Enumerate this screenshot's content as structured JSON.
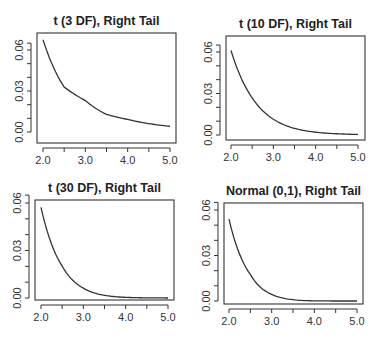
{
  "chart_data": [
    {
      "type": "line",
      "title": "t (3 DF), Right Tail",
      "xlabel": "",
      "ylabel": "",
      "xlim": [
        2.0,
        5.0
      ],
      "ylim": [
        0.0,
        0.065
      ],
      "xticks": [
        "2.0",
        "3.0",
        "4.0",
        "5.0"
      ],
      "yticks": [
        "0.00",
        "0.03",
        "0.06"
      ],
      "grid": false,
      "x": [
        2.0,
        2.5,
        3.0,
        3.5,
        4.0,
        4.5,
        5.0
      ],
      "values": [
        0.0675,
        0.0329,
        0.023,
        0.0129,
        0.0092,
        0.0061,
        0.0042
      ],
      "box": {
        "x0": 37,
        "y0": 33,
        "x1": 176,
        "y1": 143,
        "px_x2": 43,
        "px_x5": 170,
        "px_y0": 132,
        "px_y06": 50
      }
    },
    {
      "type": "line",
      "title": "t (10 DF), Right Tail",
      "xlabel": "",
      "ylabel": "",
      "xlim": [
        2.0,
        5.0
      ],
      "ylim": [
        0.0,
        0.065
      ],
      "xticks": [
        "2.0",
        "3.0",
        "4.0",
        "5.0"
      ],
      "yticks": [
        "0.00",
        "0.03",
        "0.06"
      ],
      "grid": false,
      "x": [
        2.0,
        2.5,
        3.0,
        3.5,
        4.0,
        4.5,
        5.0
      ],
      "values": [
        0.0611,
        0.0269,
        0.0114,
        0.0048,
        0.002,
        0.0009,
        0.0004
      ],
      "box": {
        "x0": 226,
        "y0": 36,
        "x1": 365,
        "y1": 140,
        "px_x2": 231,
        "px_x5": 358,
        "px_y0": 135,
        "px_y06": 52
      }
    },
    {
      "type": "line",
      "title": "t (30 DF), Right Tail",
      "xlabel": "",
      "ylabel": "",
      "xlim": [
        2.0,
        5.0
      ],
      "ylim": [
        0.0,
        0.065
      ],
      "xticks": [
        "2.0",
        "3.0",
        "4.0",
        "5.0"
      ],
      "yticks": [
        "0.00",
        "0.03",
        "0.06"
      ],
      "grid": false,
      "x": [
        2.0,
        2.5,
        3.0,
        3.5,
        4.0,
        4.5,
        5.0
      ],
      "values": [
        0.0573,
        0.0201,
        0.0062,
        0.0017,
        0.0004,
        0.0001,
        0.0
      ],
      "box": {
        "x0": 35,
        "y0": 200,
        "x1": 174,
        "y1": 300,
        "px_x2": 41,
        "px_x5": 168,
        "px_y0": 298,
        "px_y06": 203
      }
    },
    {
      "type": "line",
      "title": "Normal (0,1), Right Tail",
      "xlabel": "",
      "ylabel": "",
      "xlim": [
        2.0,
        5.0
      ],
      "ylim": [
        0.0,
        0.065
      ],
      "xticks": [
        "2.0",
        "3.0",
        "4.0",
        "5.0"
      ],
      "yticks": [
        "0.00",
        "0.03",
        "0.06"
      ],
      "grid": false,
      "x": [
        2.0,
        2.5,
        3.0,
        3.5,
        4.0,
        4.5,
        5.0
      ],
      "values": [
        0.054,
        0.0175,
        0.0044,
        0.0009,
        0.0001,
        0.0,
        0.0
      ],
      "box": {
        "x0": 224,
        "y0": 203,
        "x1": 363,
        "y1": 304,
        "px_x2": 229,
        "px_x5": 357,
        "px_y0": 301,
        "px_y06": 210
      }
    }
  ],
  "panels": [
    {
      "title": "t (3 DF), Right Tail"
    },
    {
      "title": "t (10 DF), Right Tail"
    },
    {
      "title": "t (30 DF), Right Tail"
    },
    {
      "title": "Normal (0,1), Right Tail"
    }
  ],
  "colors": {
    "line": "#333333",
    "background": "#ffffff"
  }
}
